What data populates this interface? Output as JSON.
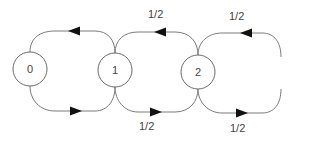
{
  "diagram": {
    "type": "state-transition",
    "nodes": [
      {
        "id": "0",
        "label": "0"
      },
      {
        "id": "1",
        "label": "1"
      },
      {
        "id": "2",
        "label": "2"
      }
    ],
    "edges": [
      {
        "from": "0",
        "to": "1",
        "path": "bottom",
        "label": ""
      },
      {
        "from": "1",
        "to": "0",
        "path": "top",
        "label": ""
      },
      {
        "from": "1",
        "to": "2",
        "path": "bottom",
        "label": "1/2"
      },
      {
        "from": "2",
        "to": "1",
        "path": "top",
        "label": "1/2"
      },
      {
        "from": "2",
        "to": "continuation",
        "path": "bottom",
        "label": "1/2"
      },
      {
        "from": "continuation",
        "to": "2",
        "path": "top",
        "label": "1/2"
      }
    ],
    "labels": {
      "top_1_2": "1/2",
      "top_2_right": "1/2",
      "bottom_1_2": "1/2",
      "bottom_2_right": "1/2"
    }
  }
}
